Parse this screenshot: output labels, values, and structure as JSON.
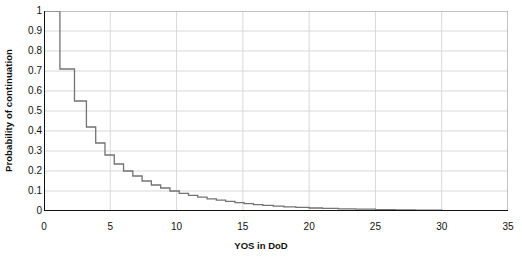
{
  "chart_data": {
    "type": "line",
    "style": "step",
    "title": "",
    "subtitle": "",
    "xlabel": "YOS in DoD",
    "ylabel": "Probability of continuation",
    "xlim": [
      0,
      35
    ],
    "ylim": [
      0,
      1
    ],
    "xticks": [
      0,
      5,
      10,
      15,
      20,
      25,
      30,
      35
    ],
    "xtick_labels": [
      "0",
      "5",
      "10",
      "15",
      "20",
      "25",
      "30",
      "35"
    ],
    "yticks": [
      0,
      0.1,
      0.2,
      0.3,
      0.4,
      0.5,
      0.6,
      0.7,
      0.8,
      0.9,
      1
    ],
    "ytick_labels": [
      "0",
      "0.1",
      "0.2",
      "0.3",
      "0.4",
      "0.5",
      "0.6",
      "0.7",
      "0.8",
      "0.9",
      "1"
    ],
    "grid": {
      "horizontal": true,
      "vertical": true,
      "color": "#d9d9d9"
    },
    "legend": null,
    "annotations": [],
    "series": [
      {
        "name": "Probability of continuation",
        "color": "#737373",
        "line_width": 1.3,
        "x": [
          0,
          1.2,
          2.3,
          3.2,
          3.9,
          4.6,
          5.3,
          6.0,
          6.7,
          7.4,
          8.1,
          8.8,
          9.5,
          10.2,
          10.9,
          11.6,
          12.3,
          13.0,
          13.7,
          14.4,
          15.1,
          15.8,
          16.5,
          17.3,
          18.1,
          19.0,
          20.0,
          21.0,
          22.2,
          23.5,
          25.0,
          26.5,
          28.0,
          30.0,
          32.0
        ],
        "y": [
          1.0,
          0.71,
          0.55,
          0.42,
          0.34,
          0.28,
          0.235,
          0.2,
          0.175,
          0.15,
          0.13,
          0.115,
          0.1,
          0.088,
          0.078,
          0.069,
          0.061,
          0.054,
          0.048,
          0.042,
          0.037,
          0.032,
          0.028,
          0.024,
          0.021,
          0.018,
          0.015,
          0.013,
          0.011,
          0.009,
          0.007,
          0.005,
          0.004,
          0.002,
          0.0
        ]
      }
    ]
  },
  "axes": {
    "ylabel_text": "Probability of continuation",
    "xlabel_text": "YOS in DoD"
  }
}
